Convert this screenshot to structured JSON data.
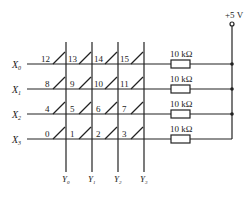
{
  "supply": {
    "label": "+5 V"
  },
  "rows": [
    {
      "label": "X",
      "sub": "0",
      "keys": [
        "12",
        "13",
        "14",
        "15"
      ],
      "resistor": "10 kΩ"
    },
    {
      "label": "X",
      "sub": "1",
      "keys": [
        "8",
        "9",
        "10",
        "11"
      ],
      "resistor": "10 kΩ"
    },
    {
      "label": "X",
      "sub": "2",
      "keys": [
        "4",
        "5",
        "6",
        "7"
      ],
      "resistor": "10 kΩ"
    },
    {
      "label": "X",
      "sub": "3",
      "keys": [
        "0",
        "1",
        "2",
        "3"
      ],
      "resistor": "10 kΩ"
    }
  ],
  "columns": [
    {
      "label": "Y",
      "sub": "0"
    },
    {
      "label": "Y",
      "sub": "1"
    },
    {
      "label": "Y",
      "sub": "2"
    },
    {
      "label": "Y",
      "sub": "3"
    }
  ]
}
